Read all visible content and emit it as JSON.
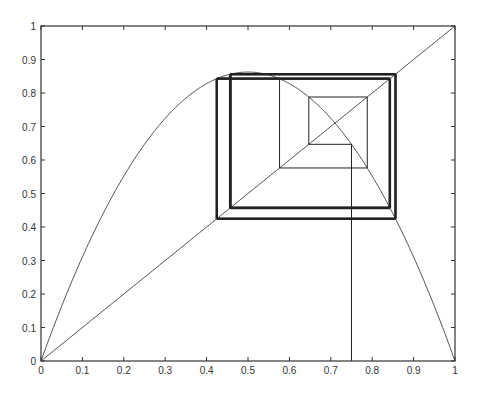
{
  "chart_data": {
    "type": "line",
    "title": "",
    "xlabel": "",
    "ylabel": "",
    "xlim": [
      0,
      1
    ],
    "ylim": [
      0,
      1
    ],
    "grid": false,
    "x_ticks": [
      "0",
      "0.1",
      "0.2",
      "0.3",
      "0.4",
      "0.5",
      "0.6",
      "0.7",
      "0.8",
      "0.9",
      "1"
    ],
    "y_ticks": [
      "0",
      "0.1",
      "0.2",
      "0.3",
      "0.4",
      "0.5",
      "0.6",
      "0.7",
      "0.8",
      "0.9",
      "1"
    ],
    "series": [
      {
        "name": "logistic-curve",
        "r": 3.45,
        "peak": [
          0.5,
          0.8625
        ]
      },
      {
        "name": "identity-line",
        "points": [
          [
            0,
            0
          ],
          [
            1,
            1
          ]
        ]
      },
      {
        "name": "cobweb",
        "x0": 0.75,
        "iterations": 14,
        "thick_after": 4,
        "orbit": [
          0.75,
          0.6469,
          0.788,
          0.5764,
          0.8423,
          0.4583,
          0.8565,
          0.424,
          0.8426,
          0.4575,
          0.8565,
          0.4241,
          0.8426,
          0.4575
        ]
      }
    ],
    "colors": {
      "axis": "#333333",
      "curve": "#555555",
      "cobweb": "#222222"
    }
  }
}
